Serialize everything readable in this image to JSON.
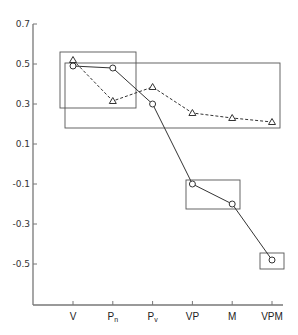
{
  "chart_data": {
    "type": "line",
    "title": "",
    "xlabel": "",
    "ylabel": "",
    "ylim": [
      -0.7,
      0.7
    ],
    "grid": false,
    "legend": null,
    "categories": [
      "V",
      "Pn",
      "Pv",
      "VP",
      "M",
      "VPM"
    ],
    "category_labels": [
      {
        "main": "V",
        "sub": ""
      },
      {
        "main": "P",
        "sub": "n"
      },
      {
        "main": "P",
        "sub": "v"
      },
      {
        "main": "VP",
        "sub": ""
      },
      {
        "main": "M",
        "sub": ""
      },
      {
        "main": "VPM",
        "sub": ""
      }
    ],
    "yticks": [
      0.7,
      0.5,
      0.3,
      0.1,
      -0.1,
      -0.3,
      -0.5
    ],
    "ytick_labels": [
      "0.7",
      "0.5",
      "0.3",
      "0.1",
      "-0.1",
      "-0.3",
      "-0.5"
    ],
    "series": [
      {
        "name": "solid-circles",
        "marker": "circle",
        "line": "solid",
        "values": [
          0.49,
          0.48,
          0.3,
          -0.1,
          -0.2,
          -0.48
        ]
      },
      {
        "name": "dashed-triangles",
        "marker": "triangle",
        "line": "dashed",
        "values": [
          0.52,
          0.315,
          0.385,
          0.255,
          0.23,
          0.21
        ]
      }
    ],
    "annotations": [
      {
        "type": "box",
        "x_from": "V-",
        "x_to": "Pn+",
        "y_top": 0.56,
        "y_bottom": 0.28
      },
      {
        "type": "box",
        "x_from": "V-",
        "x_to": "VPM+",
        "y_top": 0.505,
        "y_bottom": 0.18
      },
      {
        "type": "box",
        "x_from": "VP-",
        "x_to": "M+",
        "y_top": -0.075,
        "y_bottom": -0.22
      },
      {
        "type": "box",
        "x_from": "VPM-",
        "x_to": "VPM+",
        "y_top": -0.44,
        "y_bottom": -0.52
      }
    ]
  },
  "colors": {
    "axis": "#777777",
    "line": "#333333",
    "box": "#555555",
    "background": "#ffffff"
  }
}
